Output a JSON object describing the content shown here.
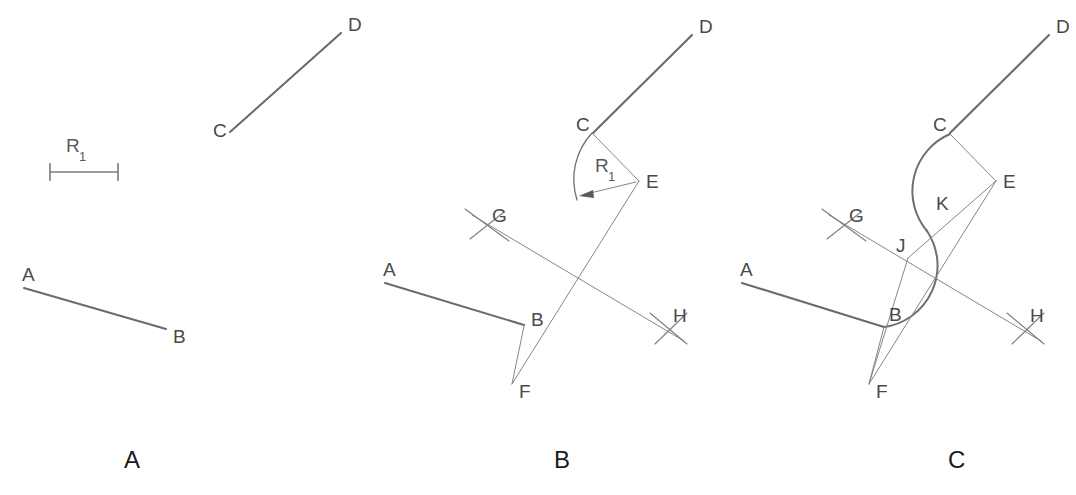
{
  "figure": {
    "stroke_heavy": "#6b6b6b",
    "stroke_light": "#868686",
    "label_color": "#4a4a4a",
    "panel_label_color": "#1b1b1b",
    "background": "#ffffff"
  },
  "radius": {
    "symbol": "R",
    "subscript": "1",
    "full": "R1"
  },
  "panels": [
    {
      "id": "A",
      "label": "A",
      "label_pos": {
        "x": 130,
        "y": 468
      },
      "caption": "Given: two non-parallel lines AB and CD, plus radius R1",
      "points": [
        {
          "name": "A",
          "label": "A",
          "x": 24,
          "y": 288,
          "label_x": 22,
          "label_y": 281
        },
        {
          "name": "B",
          "label": "B",
          "x": 166,
          "y": 329,
          "label_x": 173,
          "label_y": 343
        },
        {
          "name": "C",
          "label": "C",
          "x": 230,
          "y": 132,
          "label_x": 215,
          "label_y": 136
        },
        {
          "name": "D",
          "label": "D",
          "x": 341,
          "y": 33,
          "label_x": 348,
          "label_y": 31
        }
      ],
      "segments": [
        {
          "name": "line-AB",
          "from": "A",
          "to": "B",
          "weight": "heavy"
        },
        {
          "name": "line-CD",
          "from": "C",
          "to": "D",
          "weight": "heavy"
        }
      ],
      "scale_bar": {
        "name": "radius-scale-bar",
        "x1": 50,
        "x2": 118,
        "y": 172,
        "tick_half_height": 9,
        "label_x": 68,
        "label_y": 152
      }
    },
    {
      "id": "B",
      "label": "B",
      "label_pos": {
        "x": 560,
        "y": 468
      },
      "caption": "Step 1: swing radius R1 arc from C; erect perpendicular bisectors meeting at G and H",
      "points": [
        {
          "name": "A",
          "label": "A",
          "x": 385,
          "y": 283,
          "label_x": 383,
          "label_y": 276
        },
        {
          "name": "B",
          "label": "B",
          "x": 524,
          "y": 325,
          "label_x": 533,
          "label_y": 325
        },
        {
          "name": "C",
          "label": "C",
          "x": 593,
          "y": 133,
          "label_x": 578,
          "label_y": 130
        },
        {
          "name": "D",
          "label": "D",
          "x": 692,
          "y": 35,
          "label_x": 699,
          "label_y": 33
        },
        {
          "name": "E",
          "label": "E",
          "x": 639,
          "y": 181,
          "label_x": 647,
          "label_y": 183
        },
        {
          "name": "F",
          "label": "F",
          "x": 513,
          "y": 385,
          "label_x": 521,
          "label_y": 398
        },
        {
          "name": "G",
          "label": "G",
          "x": 487,
          "y": 226,
          "label_x": 493,
          "label_y": 221
        },
        {
          "name": "H",
          "label": "H",
          "x": 668,
          "y": 328,
          "label_x": 674,
          "label_y": 322
        }
      ],
      "segments": [
        {
          "name": "line-AB",
          "from": "A",
          "to": "B",
          "weight": "heavy"
        },
        {
          "name": "line-CD",
          "from": "C",
          "to": "D",
          "weight": "heavy"
        },
        {
          "name": "line-BF",
          "from": "B",
          "to": "F",
          "weight": "light"
        },
        {
          "name": "line-CE",
          "from": "C",
          "to": "E",
          "weight": "light"
        },
        {
          "name": "line-EF",
          "from": "E",
          "to": "F",
          "weight": "light"
        },
        {
          "name": "line-GH",
          "from": "G",
          "to": "H",
          "weight": "light"
        }
      ],
      "radius_arc": {
        "name": "radius-arc-from-C",
        "center_x": 639,
        "center_y": 181,
        "radius": 68,
        "start_x": 592,
        "start_y": 133,
        "end_x": 578,
        "end_y": 199
      },
      "radius_arrow": {
        "name": "radius-dimension-arrow",
        "from_x": 634,
        "from_y": 183,
        "to_x": 578,
        "to_y": 196
      },
      "radius_label": {
        "x": 597,
        "y": 172
      }
    },
    {
      "id": "C",
      "label": "C",
      "label_pos": {
        "x": 955,
        "y": 468
      },
      "caption": "Step 2: draw the two tangent arcs from G and H forming the ogee through J, K",
      "points": [
        {
          "name": "A",
          "label": "A",
          "x": 742,
          "y": 283,
          "label_x": 740,
          "label_y": 276
        },
        {
          "name": "B",
          "label": "B",
          "x": 884,
          "y": 326,
          "label_x": 891,
          "label_y": 321
        },
        {
          "name": "C",
          "label": "C",
          "x": 950,
          "y": 133,
          "label_x": 935,
          "label_y": 130
        },
        {
          "name": "D",
          "label": "D",
          "x": 1049,
          "y": 35,
          "label_x": 1056,
          "label_y": 33
        },
        {
          "name": "E",
          "label": "E",
          "x": 996,
          "y": 181,
          "label_x": 1004,
          "label_y": 183
        },
        {
          "name": "F",
          "label": "F",
          "x": 870,
          "y": 385,
          "label_x": 878,
          "label_y": 398
        },
        {
          "name": "G",
          "label": "G",
          "x": 844,
          "y": 226,
          "label_x": 850,
          "label_y": 221
        },
        {
          "name": "H",
          "label": "H",
          "x": 1025,
          "y": 328,
          "label_x": 1031,
          "label_y": 322
        },
        {
          "name": "J",
          "label": "J",
          "x": 910,
          "y": 255,
          "label_x": 902,
          "label_y": 250
        },
        {
          "name": "K",
          "label": "K",
          "x": 945,
          "y": 212,
          "label_x": 940,
          "label_y": 207
        }
      ],
      "segments": [
        {
          "name": "line-AB",
          "from": "A",
          "to": "B",
          "weight": "heavy"
        },
        {
          "name": "line-CD",
          "from": "C",
          "to": "D",
          "weight": "heavy"
        },
        {
          "name": "line-CE",
          "from": "C",
          "to": "E",
          "weight": "light"
        },
        {
          "name": "line-EF",
          "from": "E",
          "to": "F",
          "weight": "light"
        },
        {
          "name": "line-BF",
          "from": "B",
          "to": "F",
          "weight": "light"
        },
        {
          "name": "line-GH",
          "from": "G",
          "to": "H",
          "weight": "light"
        },
        {
          "name": "line-EJ",
          "from": "E",
          "to": "J",
          "weight": "light"
        },
        {
          "name": "line-JF",
          "from": "J",
          "to": "F",
          "weight": "light"
        }
      ],
      "ogee": {
        "name": "ogee-curve",
        "start_x": 950,
        "start_y": 134,
        "mid_x": 927,
        "mid_y": 230,
        "end_x": 884,
        "end_y": 327,
        "arc1_radius": 62,
        "arc2_radius": 62
      }
    }
  ]
}
